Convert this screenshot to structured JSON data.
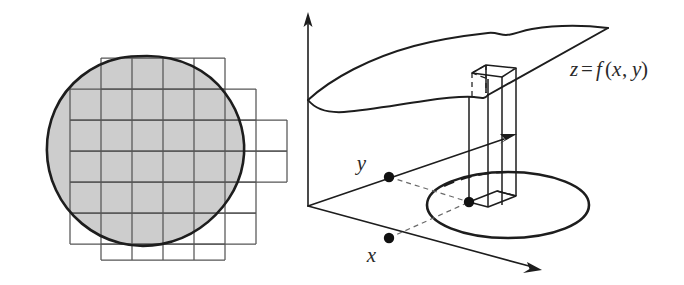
{
  "figure": {
    "name": "double-integral-illustration",
    "width": 684,
    "height": 285,
    "background_color": "#ffffff"
  },
  "panels": [
    {
      "id": "left-panel",
      "name": "grid-partitioned-region",
      "description": "Plane region covered by a rectangular grid partition"
    },
    {
      "id": "right-panel",
      "name": "surface-with-column",
      "description": "Surface z=f(x,y) above an elliptical domain with one sample column"
    }
  ],
  "left_panel": {
    "region": {
      "name": "shaded-region",
      "fill_color": "#cdcdcd",
      "outline_color": "#1d1d1d"
    },
    "grid": {
      "name": "partition-grid",
      "line_color": "#565656",
      "cell_size": 31,
      "columns": 7,
      "rows": 7
    }
  },
  "right_panel": {
    "axes": [
      {
        "name": "z-axis",
        "label": ""
      },
      {
        "name": "y-axis",
        "label": "y"
      },
      {
        "name": "x-axis",
        "label": "x"
      }
    ],
    "labels": {
      "y_label": "y",
      "x_label": "x",
      "surface_label_lhs": "z",
      "surface_label_eq": "=",
      "surface_label_fn": "f",
      "surface_label_open": "(",
      "surface_label_x": "x",
      "surface_label_comma": ",",
      "surface_label_y": "y",
      "surface_label_close": ")",
      "surface_label_full": "z=f(x, y)"
    },
    "surface": {
      "name": "surface-sheet",
      "stroke_color": "#1d1d1d"
    },
    "domain": {
      "name": "domain-ellipse",
      "stroke_color": "#1d1d1d"
    },
    "column": {
      "name": "sample-column",
      "stroke_color": "#1d1d1d"
    },
    "points": [
      {
        "name": "y-sample-point"
      },
      {
        "name": "x-sample-point"
      },
      {
        "name": "domain-sample-point"
      }
    ]
  }
}
